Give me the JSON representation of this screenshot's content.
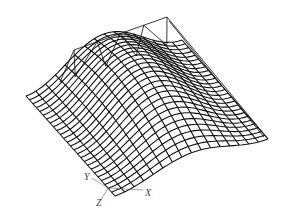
{
  "figure": {
    "colors": {
      "mesh": "#111111",
      "truss": "#222222",
      "axis": "#555555",
      "background": "#ffffff"
    }
  },
  "surface": {
    "corners": {
      "left": [
        26,
        96
      ],
      "front": [
        115,
        196
      ],
      "right": [
        268,
        139
      ],
      "back": [
        182,
        40
      ]
    },
    "rise": 42,
    "grid_u": 16,
    "grid_v": 26
  },
  "truss": {
    "top_chord": [
      [
        74,
        50
      ],
      [
        167,
        17
      ]
    ],
    "bottom_chord": [
      [
        60,
        82
      ],
      [
        182,
        40
      ]
    ],
    "right_edge": [
      [
        167,
        17
      ],
      [
        268,
        139
      ]
    ],
    "panels": 4
  },
  "axes": {
    "origin": [
      108,
      188
    ],
    "labels": [
      {
        "name": "x-axis-label",
        "text": "X",
        "pos": [
          145,
          196
        ]
      },
      {
        "name": "y-axis-label",
        "text": "Y",
        "pos": [
          84,
          180
        ]
      },
      {
        "name": "z-axis-label",
        "text": "Z",
        "pos": [
          96,
          206
        ]
      }
    ]
  }
}
